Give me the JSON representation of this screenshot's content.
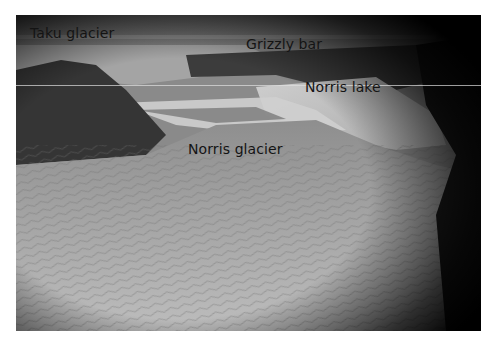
{
  "image": {
    "description": "Grayscale aerial photograph of a glacier landscape with place-name annotations",
    "labels": {
      "taku_glacier": "Taku glacier",
      "grizzly_bar": "Grizzly bar",
      "norris_lake": "Norris lake",
      "norris_glacier": "Norris glacier"
    }
  }
}
